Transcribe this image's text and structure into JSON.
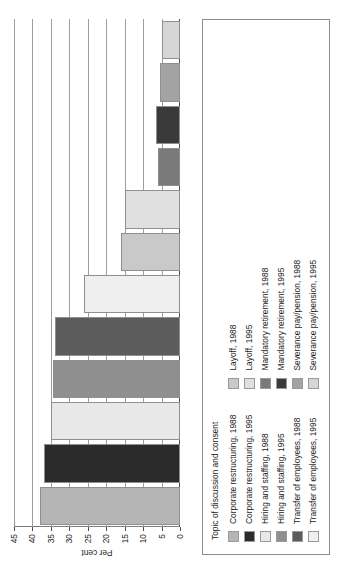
{
  "chart_data": {
    "type": "bar",
    "title": "",
    "subtitle": "",
    "xlabel": "",
    "ylabel": "Per cent",
    "ylim": [
      0,
      45
    ],
    "ytick_labels": [
      "0",
      "5",
      "10",
      "15",
      "20",
      "25",
      "30",
      "35",
      "40",
      "45"
    ],
    "ytick_values": [
      0,
      5,
      10,
      15,
      20,
      25,
      30,
      35,
      40,
      45
    ],
    "grid": true,
    "orientation": "vertical",
    "legend_position": "bottom",
    "legend_title": "Topic of discussion and consent",
    "categories": [
      "Corporate restructuring, 1988",
      "Corporate restructuring, 1995",
      "Hiring and staffing, 1988",
      "Hiring and staffing, 1995",
      "Transfer of employees, 1988",
      "Transfer of employees, 1995",
      "Layoff, 1988",
      "Layoff, 1995",
      "Mandatory retirement, 1988",
      "Mandatory retirement, 1995",
      "Severance pay/pension, 1988",
      "Severance pay/pension, 1995"
    ],
    "values": [
      38,
      37,
      35,
      34.5,
      34,
      26,
      16,
      15,
      6,
      6.5,
      5.5,
      5
    ],
    "colors": [
      "#b5b5b5",
      "#2b2b2b",
      "#e8e8e8",
      "#8f8f8f",
      "#5c5c5c",
      "#efefef",
      "#c9c9c9",
      "#e0e0e0",
      "#7a7a7a",
      "#3a3a3a",
      "#a3a3a3",
      "#d6d6d6"
    ]
  },
  "legend": {
    "title": "Topic of discussion and consent",
    "items": [
      {
        "label": "Corporate restructuring, 1988",
        "color": "#b5b5b5"
      },
      {
        "label": "Corporate restructuring, 1995",
        "color": "#2b2b2b"
      },
      {
        "label": "Hiring and staffing, 1988",
        "color": "#e8e8e8"
      },
      {
        "label": "Hiring and staffing, 1995",
        "color": "#8f8f8f"
      },
      {
        "label": "Transfer of employees, 1988",
        "color": "#5c5c5c"
      },
      {
        "label": "Transfer of employees, 1995",
        "color": "#efefef"
      },
      {
        "label": "Layoff, 1988",
        "color": "#c9c9c9"
      },
      {
        "label": "Layoff, 1995",
        "color": "#e0e0e0"
      },
      {
        "label": "Mandatory retirement, 1988",
        "color": "#7a7a7a"
      },
      {
        "label": "Mandatory retirement, 1995",
        "color": "#3a3a3a"
      },
      {
        "label": "Severance pay/pension, 1988",
        "color": "#a3a3a3"
      },
      {
        "label": "Severance pay/pension, 1995",
        "color": "#d6d6d6"
      }
    ]
  },
  "axis": {
    "y_title": "Per cent",
    "ticks": [
      "45",
      "40",
      "35",
      "30",
      "25",
      "20",
      "15",
      "10",
      "5",
      "0"
    ]
  }
}
